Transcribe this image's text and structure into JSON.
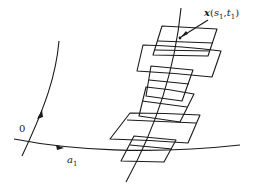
{
  "figure": {
    "labels": {
      "point": {
        "vector": "x",
        "open": "(",
        "s": "s",
        "s_sub": "1",
        "comma": ",",
        "t": "t",
        "t_sub": "1",
        "close": ")"
      },
      "origin": "0",
      "curve": "a",
      "curve_sub": "1"
    },
    "colors": {
      "stroke": "#1a1a1a",
      "background": "#ffffff"
    },
    "patch_count": 6
  }
}
